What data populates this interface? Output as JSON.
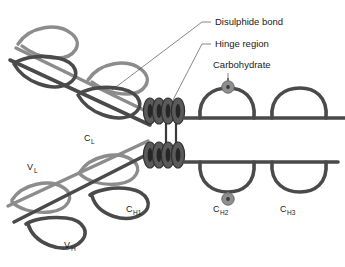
{
  "figure": {
    "background_color": "#ffffff"
  },
  "colors": {
    "heavy_chain": "#4a4a4a",
    "light_chain": "#8c8c8c",
    "hinge_bead": "#5a5a5a",
    "hinge_bead_core": "#2b2b2b",
    "carbohydrate": "#8f8f8f",
    "carbohydrate_core": "#3a3a3a",
    "leader_line": "#555555",
    "text": "#1a1a1a"
  },
  "annotations": [
    {
      "id": "disulphide",
      "label": "Disulphide bond",
      "x": 215,
      "y": 25
    },
    {
      "id": "hinge",
      "label": "Hinge region",
      "x": 215,
      "y": 47
    },
    {
      "id": "carbohydrate",
      "label": "Carbohydrate",
      "x": 213,
      "y": 68
    }
  ],
  "domain_labels": [
    {
      "id": "c-l",
      "base": "C",
      "sub": "L",
      "x": 84,
      "y": 141
    },
    {
      "id": "v-l",
      "base": "V",
      "sub": "L",
      "x": 27,
      "y": 170
    },
    {
      "id": "c-h1",
      "base": "C",
      "sub": "H1",
      "x": 126,
      "y": 212
    },
    {
      "id": "v-h",
      "base": "V",
      "sub": "H",
      "x": 64,
      "y": 248
    },
    {
      "id": "c-h2",
      "base": "C",
      "sub": "H2",
      "x": 213,
      "y": 212
    },
    {
      "id": "c-h3",
      "base": "C",
      "sub": "H3",
      "x": 280,
      "y": 212
    }
  ],
  "structure": {
    "hinge_bead_count_per_chain": 4,
    "interchain_disulphide_bonds": 2,
    "carbohydrate_spheres": 2,
    "fab_arms": 2,
    "fc_domains_per_chain": 2
  }
}
